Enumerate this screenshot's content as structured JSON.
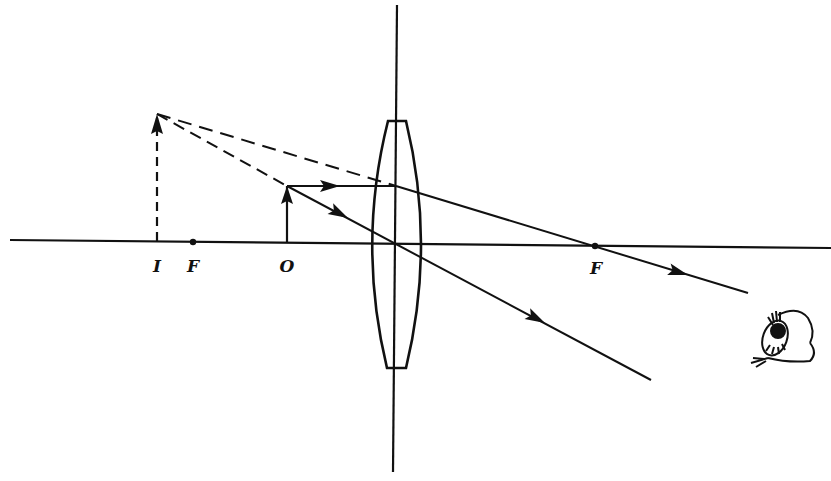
{
  "diagram": {
    "colors": {
      "ink": "#111111",
      "background": "#ffffff"
    },
    "labels": {
      "image": "I",
      "focal_left": "F",
      "object": "O",
      "focal_right": "F"
    },
    "elements": {
      "optical_axis": "horizontal principal axis",
      "lens_plane": "vertical line through lens center",
      "lens": "biconvex converging lens",
      "object_arrow": "object O (upright, inside focal length)",
      "image_arrow": "virtual image I (upright, enlarged, dashed)",
      "ray_parallel": "ray parallel to axis, refracted through far focal point F",
      "ray_center": "ray through lens center, undeviated",
      "virtual_rays": "dashed backward extensions meeting at image tip",
      "observer": "eye-icon"
    }
  }
}
